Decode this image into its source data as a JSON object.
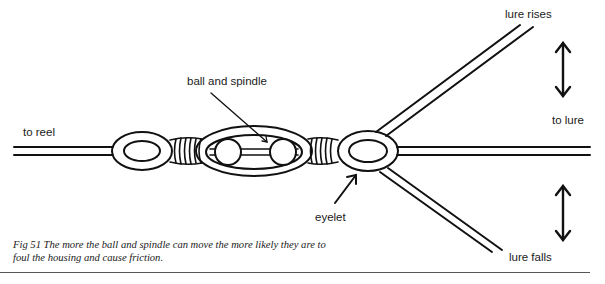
{
  "figure": {
    "number": "Fig 51",
    "caption_line1": "Fig 51  The more the ball and spindle can move the more likely they are to",
    "caption_line2": "foul the housing and cause friction."
  },
  "labels": {
    "to_reel": "to reel",
    "ball_and_spindle": "ball and spindle",
    "lure_rises": "lure rises",
    "to_lure": "to lure",
    "eyelet": "eyelet",
    "lure_falls": "lure falls"
  },
  "icons": {
    "up_down_arrow_top": "double-headed-vertical-arrow",
    "up_down_arrow_bottom": "double-headed-vertical-arrow"
  },
  "colors": {
    "ink": "#111111",
    "background": "#ffffff",
    "rule": "#555555"
  }
}
